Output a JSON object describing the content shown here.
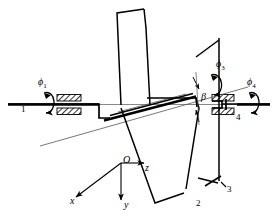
{
  "figure": {
    "kind": "mechanism-kinematic-diagram",
    "stroke_color": "#000000",
    "background_color": "#ffffff",
    "thin_line_color": "#555555"
  },
  "rotation_labels": [
    {
      "id": "phi1",
      "text": "ϕ",
      "subscript": "1",
      "x": 38,
      "y": 83
    },
    {
      "id": "phi3",
      "text": "ϕ",
      "subscript": "3",
      "x": 218,
      "y": 65
    },
    {
      "id": "phi4",
      "text": "ϕ",
      "subscript": "4",
      "x": 248,
      "y": 83
    }
  ],
  "angle_labels": [
    {
      "id": "beta",
      "text": "β",
      "x": 200,
      "y": 98
    }
  ],
  "link_numbers": [
    {
      "id": "link-1",
      "text": "1",
      "x": 22,
      "y": 110
    },
    {
      "id": "link-2",
      "text": "2",
      "x": 198,
      "y": 205
    },
    {
      "id": "link-3",
      "text": "3",
      "x": 228,
      "y": 190
    },
    {
      "id": "link-4",
      "text": "4",
      "x": 237,
      "y": 118
    }
  ],
  "coordinate_frame": {
    "origin_label": "O",
    "origin_x": 121,
    "origin_y": 163,
    "axes": [
      {
        "id": "z-axis",
        "label": "z",
        "label_x": 146,
        "label_y": 168,
        "direction": "right"
      },
      {
        "id": "y-axis",
        "label": "y",
        "label_x": 124,
        "label_y": 207,
        "direction": "down"
      },
      {
        "id": "x-axis",
        "label": "x",
        "label_x": 71,
        "label_y": 202,
        "direction": "lower-left"
      }
    ]
  },
  "icons": {
    "rotation_arrow": "curved-rotation-arrow-icon",
    "bearing_hatch": "hatched-bearing-support-icon",
    "arrowhead": "arrowhead-icon"
  }
}
